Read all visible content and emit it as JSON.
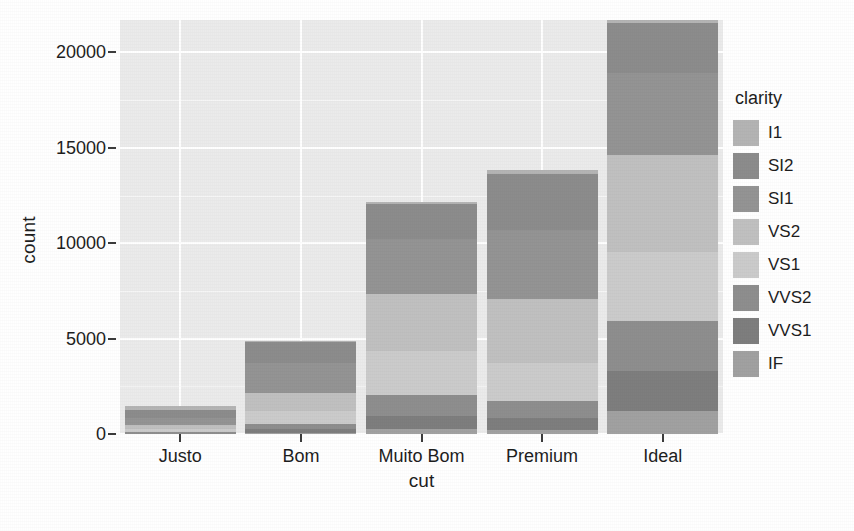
{
  "chart_data": {
    "type": "bar",
    "subtype": "stacked-bar",
    "title": "",
    "xlabel": "cut",
    "ylabel": "count",
    "categories": [
      "Justo",
      "Bom",
      "Muito Bom",
      "Premium",
      "Ideal"
    ],
    "legend_title": "clarity",
    "legend_position": "right",
    "grid": true,
    "ylim": [
      0,
      21700
    ],
    "yticks": [
      0,
      5000,
      10000,
      15000,
      20000
    ],
    "ytick_labels": [
      "0",
      "5000",
      "10000",
      "15000",
      "20000"
    ],
    "series": [
      {
        "name": "I1",
        "color": "#b4b4b4",
        "values": [
          210,
          96,
          84,
          205,
          146
        ]
      },
      {
        "name": "SI2",
        "color": "#8c8c8c",
        "values": [
          466,
          1081,
          2100,
          2949,
          2598
        ]
      },
      {
        "name": "SI1",
        "color": "#949494",
        "values": [
          408,
          1560,
          3240,
          3575,
          4282
        ]
      },
      {
        "name": "VS2",
        "color": "#c0c0c0",
        "values": [
          261,
          978,
          3357,
          3357,
          5071
        ]
      },
      {
        "name": "VS1",
        "color": "#cbcbcb",
        "values": [
          170,
          648,
          2591,
          1989,
          3589
        ]
      },
      {
        "name": "VVS2",
        "color": "#8e8e8e",
        "values": [
          69,
          286,
          1235,
          870,
          2606
        ]
      },
      {
        "name": "VVS1",
        "color": "#7e7e7e",
        "values": [
          17,
          186,
          789,
          616,
          2047
        ]
      },
      {
        "name": "IF",
        "color": "#a1a1a1",
        "values": [
          9,
          71,
          268,
          230,
          1212
        ]
      }
    ],
    "totals": [
      1610,
      4906,
      12662,
      13791,
      21551
    ],
    "bar_totals_approx": [
      1450,
      4900,
      12150,
      13850,
      21700
    ]
  },
  "axis": {
    "y_title": "count",
    "x_title": "cut"
  },
  "legend": {
    "title": "clarity",
    "items": [
      {
        "label": "I1",
        "color": "#b4b4b4"
      },
      {
        "label": "SI2",
        "color": "#8c8c8c"
      },
      {
        "label": "SI1",
        "color": "#949494"
      },
      {
        "label": "VS2",
        "color": "#c0c0c0"
      },
      {
        "label": "VS1",
        "color": "#cbcbcb"
      },
      {
        "label": "VVS2",
        "color": "#8e8e8e"
      },
      {
        "label": "VVS1",
        "color": "#7e7e7e"
      },
      {
        "label": "IF",
        "color": "#a1a1a1"
      }
    ]
  },
  "panel": {
    "background": "#ebebeb",
    "gridline_color": "#ffffff"
  }
}
